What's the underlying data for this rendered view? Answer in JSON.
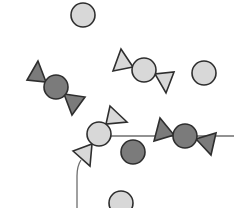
{
  "diagram": {
    "width": 234,
    "height": 208,
    "colors": {
      "background": "#ffffff",
      "light_fill": "#d8d8d8",
      "dark_fill": "#7b7b7b",
      "stroke": "#2e2e2e",
      "line": "#6e6e6e"
    },
    "circles": [
      {
        "id": "circle-top",
        "cx": 83,
        "cy": 15,
        "r": 12,
        "shade": "light"
      },
      {
        "id": "circle-right",
        "cx": 204,
        "cy": 73,
        "r": 12,
        "shade": "light"
      },
      {
        "id": "circle-dark-center",
        "cx": 133,
        "cy": 152,
        "r": 12,
        "shade": "dark"
      },
      {
        "id": "circle-bottom",
        "cx": 121,
        "cy": 203,
        "r": 12,
        "shade": "light"
      }
    ],
    "candies": [
      {
        "id": "candy-dark-left",
        "shade": "dark",
        "circle": {
          "cx": 56,
          "cy": 87,
          "r": 12
        },
        "triangles": [
          [
            [
              38,
              61
            ],
            [
              27,
              80
            ],
            [
              46,
              82
            ]
          ],
          [
            [
              72,
              115
            ],
            [
              85,
              97
            ],
            [
              64,
              94
            ]
          ]
        ]
      },
      {
        "id": "candy-light-middle",
        "shade": "light",
        "circle": {
          "cx": 144,
          "cy": 70,
          "r": 12
        },
        "triangles": [
          [
            [
              121,
              49
            ],
            [
              113,
              71
            ],
            [
              133,
              67
            ]
          ],
          [
            [
              174,
              72
            ],
            [
              166,
              93
            ],
            [
              155,
              74
            ]
          ]
        ]
      },
      {
        "id": "candy-light-center",
        "shade": "light",
        "circle": {
          "cx": 99,
          "cy": 134,
          "r": 12
        },
        "triangles": [
          [
            [
              110,
              106
            ],
            [
              127,
              122
            ],
            [
              106,
              124
            ]
          ],
          [
            [
              73,
              151
            ],
            [
              90,
              166
            ],
            [
              92,
              144
            ]
          ]
        ]
      },
      {
        "id": "candy-dark-right",
        "shade": "dark",
        "circle": {
          "cx": 185,
          "cy": 136,
          "r": 12
        },
        "triangles": [
          [
            [
              160,
              118
            ],
            [
              154,
              141
            ],
            [
              174,
              135
            ]
          ],
          [
            [
              216,
              133
            ],
            [
              211,
              155
            ],
            [
              196,
              139
            ]
          ]
        ]
      }
    ],
    "lines": [
      {
        "id": "line-horizontal",
        "d": "M 111 136 L 234 136"
      },
      {
        "id": "line-vertical",
        "d": "M 81 160 Q 77 166 77 176 L 77 208"
      }
    ]
  }
}
